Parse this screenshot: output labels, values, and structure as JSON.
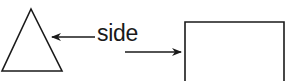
{
  "diagram": {
    "label": "side",
    "shapes": [
      {
        "type": "triangle",
        "name": "equilateral-triangle"
      },
      {
        "type": "rectangle",
        "name": "square"
      }
    ],
    "arrows": [
      {
        "from": "label",
        "to": "triangle-side",
        "direction": "left"
      },
      {
        "from": "label",
        "to": "square-side",
        "direction": "right"
      }
    ],
    "stroke_color": "#1a1a1a"
  }
}
